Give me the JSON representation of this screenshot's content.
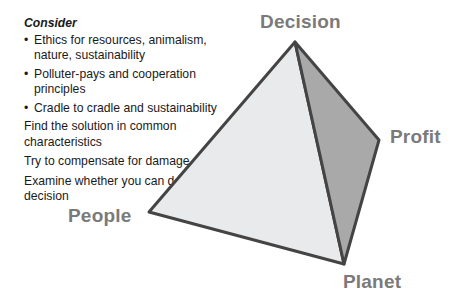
{
  "text_block": {
    "heading": "Consider",
    "bullets": [
      "Ethics for resources, animalism, nature, sustainability",
      "Polluter-pays and cooperation principles",
      "Cradle to cradle and sustainability"
    ],
    "bullet_glyph": "•",
    "paragraphs": [
      "Find the solution in common characteristics",
      "Try to compensate for damage",
      "Examine whether you can defend your decision"
    ]
  },
  "pyramid": {
    "vertices": {
      "decision": [
        295,
        42
      ],
      "profit": [
        379,
        140
      ],
      "planet": [
        344,
        264
      ],
      "people": [
        149,
        212
      ]
    },
    "colors": {
      "left_face": "#e9eaec",
      "right_face": "#a9a9a9",
      "edge": "#444444",
      "label": "#7a7a7a"
    },
    "labels": {
      "decision": "Decision",
      "profit": "Profit",
      "planet": "Planet",
      "people": "People"
    }
  }
}
